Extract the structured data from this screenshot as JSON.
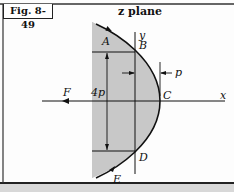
{
  "figure": {
    "label": "Fig. 8-49",
    "title": "z plane"
  },
  "labels": {
    "A": "A",
    "B": "B",
    "C": "C",
    "D": "D",
    "E": "E",
    "F": "F",
    "x_axis": "x",
    "y_axis": "y",
    "height": "4p",
    "offset": "p"
  },
  "colors": {
    "shade": "#c8c8c8",
    "line": "#111111",
    "background": "#fdfdfd"
  }
}
